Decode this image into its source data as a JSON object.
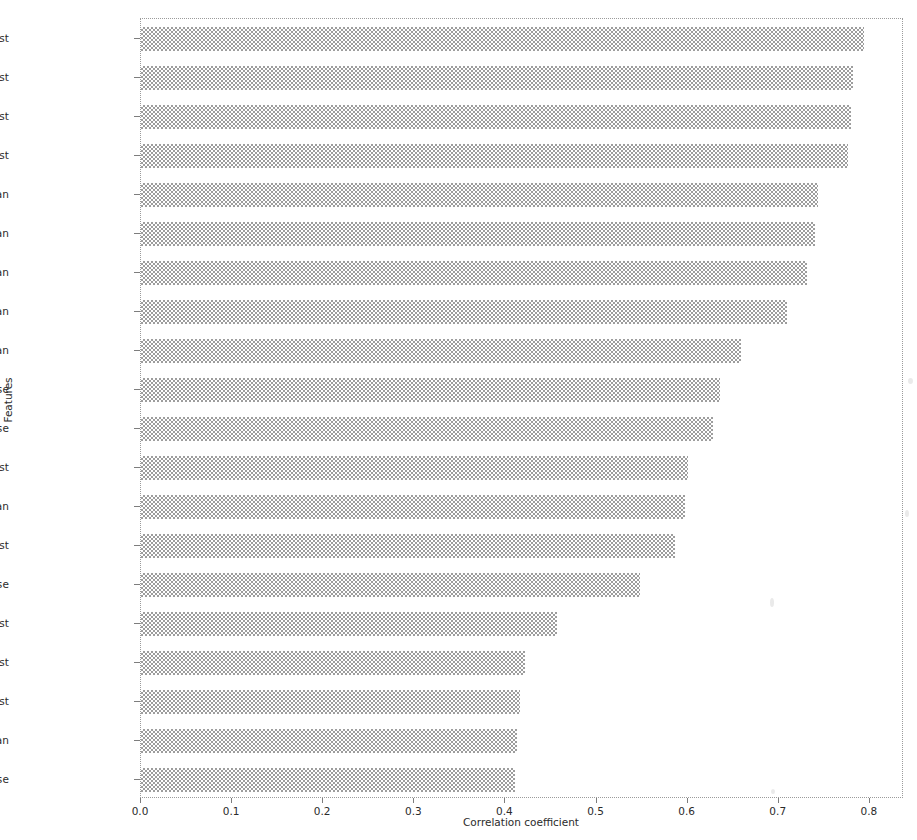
{
  "chart_data": {
    "type": "bar",
    "orientation": "horizontal",
    "title": "",
    "xlabel": "Correlation coefficient",
    "ylabel": "Features",
    "xlim": [
      0.0,
      0.8375
    ],
    "xticks": [
      0.0,
      0.1,
      0.2,
      0.3,
      0.4,
      0.5,
      0.6,
      0.7,
      0.8
    ],
    "xticklabels": [
      "0.0",
      "0.1",
      "0.2",
      "0.3",
      "0.4",
      "0.5",
      "0.6",
      "0.7",
      "0.8"
    ],
    "grid": false,
    "legend": null,
    "bar_color": "#9d9d9d",
    "categories": [
      "concave points_worst",
      "area_worst",
      "perimeter_worst",
      "radius_worst",
      "perimeter_mean",
      "cencave points_mean",
      "radius_mean",
      "area_mean",
      "concavity_mean",
      "perimeter_se",
      "radius_se",
      "concavity_worst",
      "compactness_mean",
      "compactness_worst",
      "area_se",
      "texture_worst",
      "smoothness_worst",
      "symmetry_worst",
      "texture_mean",
      "concavity_se"
    ],
    "values": [
      0.794,
      0.781,
      0.779,
      0.776,
      0.743,
      0.74,
      0.731,
      0.709,
      0.659,
      0.636,
      0.628,
      0.6,
      0.597,
      0.586,
      0.548,
      0.457,
      0.422,
      0.416,
      0.413,
      0.41
    ]
  },
  "axes": {
    "xlabel": "Correlation coefficient",
    "ylabel": "Features"
  }
}
